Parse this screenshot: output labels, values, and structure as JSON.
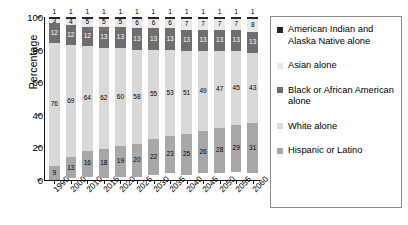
{
  "chart_data": {
    "type": "bar",
    "stacked": true,
    "title": "",
    "xlabel": "",
    "ylabel": "Percentage",
    "ylim": [
      0,
      100
    ],
    "yticks": [
      0,
      20,
      40,
      60,
      80,
      100
    ],
    "grid": false,
    "legend_position": "right",
    "categories": [
      "1990",
      "2000",
      "2010",
      "2015",
      "2020",
      "2025",
      "2030",
      "2035",
      "2040",
      "2045",
      "2050",
      "2055",
      "2060"
    ],
    "series": [
      {
        "name": "Hispanic or Latino",
        "color": "#a8a8a8",
        "values": [
          9,
          13,
          16,
          18,
          19,
          20,
          22,
          23,
          25,
          26,
          28,
          29,
          31
        ]
      },
      {
        "name": "White alone",
        "color": "#d9d9d9",
        "values": [
          76,
          69,
          64,
          62,
          60,
          58,
          55,
          53,
          51,
          49,
          47,
          45,
          43
        ]
      },
      {
        "name": "Black or African American alone",
        "color": "#6e6e6e",
        "values": [
          12,
          12,
          12,
          13,
          13,
          13,
          13,
          13,
          13,
          13,
          13,
          13,
          13
        ]
      },
      {
        "name": "Asian alone",
        "color": "#e8e8e8",
        "values": [
          3,
          4,
          5,
          5,
          5,
          6,
          6,
          6,
          7,
          7,
          7,
          7,
          8
        ]
      },
      {
        "name": "American Indian and Alaska Native alone",
        "color": "#262626",
        "values": [
          1,
          1,
          1,
          1,
          1,
          1,
          1,
          1,
          1,
          1,
          1,
          1,
          1
        ]
      }
    ]
  },
  "legend": {
    "items": [
      {
        "label": "American Indian and Alaska Native alone",
        "color": "#262626"
      },
      {
        "label": "Asian alone",
        "color": "#e8e8e8"
      },
      {
        "label": "Black or African American alone",
        "color": "#6e6e6e"
      },
      {
        "label": "White alone",
        "color": "#d9d9d9"
      },
      {
        "label": "Hispanic or Latino",
        "color": "#a8a8a8"
      }
    ]
  }
}
